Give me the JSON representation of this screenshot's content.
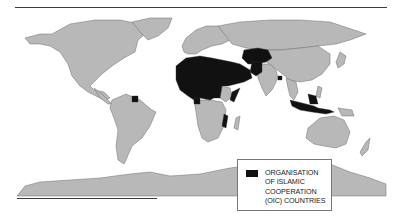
{
  "map": {
    "title": "",
    "projection": "world",
    "colors": {
      "land": "#b8b8b8",
      "oic": "#111111",
      "border": "#6e6e6e",
      "ocean": "#ffffff"
    },
    "highlighted_regions": [
      "North Africa",
      "West Africa",
      "Middle East",
      "Central Asia",
      "Pakistan",
      "Afghanistan",
      "Bangladesh",
      "Malaysia",
      "Indonesia",
      "Suriname",
      "Guyana",
      "Mozambique",
      "Uganda",
      "Somalia"
    ]
  },
  "legend": {
    "swatch_color": "#111111",
    "lines": [
      "ORGANISATION",
      "OF ISLAMIC",
      "COOPERATION",
      "(OIC) COUNTRIES"
    ]
  }
}
